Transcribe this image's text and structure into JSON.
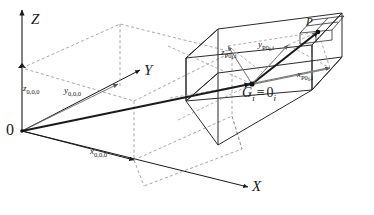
{
  "figure": {
    "background_color": "#ffffff",
    "line_color": "#1a1a1a",
    "dashed_color": "#8a8a8a",
    "width": 374,
    "height": 215
  },
  "axes": {
    "z": {
      "label": "Z",
      "name": "z-axis"
    },
    "y": {
      "label": "Y",
      "name": "y-axis"
    },
    "x": {
      "label": "X",
      "name": "x-axis"
    },
    "origin": {
      "label": "0",
      "name": "global-origin"
    }
  },
  "global_offsets": {
    "z": {
      "symbol": "z",
      "subscript": "0,0,0"
    },
    "y": {
      "symbol": "y",
      "subscript": "0,0,0"
    },
    "x": {
      "symbol": "x",
      "subscript": "0,0,0"
    }
  },
  "local_frame": {
    "origin_symbol": "G",
    "origin_subscript": "i",
    "equivalence": "≡",
    "local_zero": "0",
    "local_zero_subscript": "i",
    "point_label": "P"
  },
  "local_offsets": {
    "z": {
      "symbol": "z",
      "subscript": "P0",
      "sub2": "i",
      "sub3": ",i"
    },
    "y": {
      "symbol": "y",
      "subscript": "P0",
      "sub2": "i",
      "sub3": ",i"
    },
    "x": {
      "symbol": "x",
      "subscript": "P0",
      "sub2": "i",
      "sub3": ",i"
    }
  }
}
